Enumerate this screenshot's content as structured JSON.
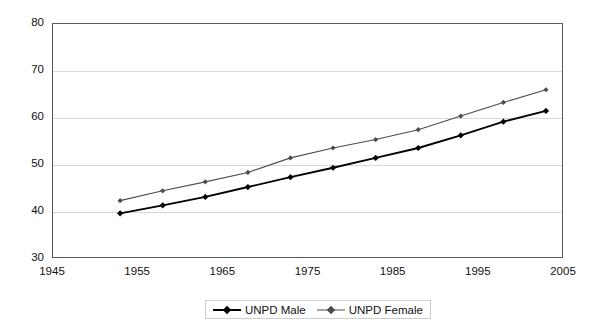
{
  "chart_data": {
    "type": "line",
    "title": "",
    "subtitle": "",
    "xlabel": "",
    "ylabel": "",
    "xlim": [
      1945,
      2005
    ],
    "ylim": [
      30,
      80
    ],
    "xticks": [
      1945,
      1955,
      1965,
      1975,
      1985,
      1995,
      2005
    ],
    "yticks": [
      30,
      40,
      50,
      60,
      70,
      80
    ],
    "grid": "horizontal",
    "legend_position": "bottom-center",
    "x": [
      1953,
      1958,
      1963,
      1968,
      1973,
      1978,
      1983,
      1988,
      1993,
      1998,
      2003
    ],
    "series": [
      {
        "name": "UNPD Male",
        "color": "#000000",
        "marker": "diamond",
        "line_width": 1.9,
        "values": [
          39.5,
          41.2,
          43.0,
          45.1,
          47.2,
          49.2,
          51.3,
          53.4,
          56.1,
          59.0,
          61.3
        ]
      },
      {
        "name": "UNPD Female",
        "color": "#4d4d4d",
        "marker": "diamond",
        "line_width": 1.1,
        "values": [
          42.2,
          44.3,
          46.2,
          48.2,
          51.3,
          53.4,
          55.2,
          57.3,
          60.2,
          63.1,
          65.8
        ]
      }
    ]
  },
  "axes": {
    "y_tick_labels": [
      "80",
      "70",
      "60",
      "50",
      "40",
      "30"
    ],
    "x_tick_labels": [
      "1945",
      "1955",
      "1965",
      "1975",
      "1985",
      "1995",
      "2005"
    ]
  },
  "legend": {
    "items": [
      {
        "label": "UNPD Male",
        "color": "#000000"
      },
      {
        "label": "UNPD Female",
        "color": "#4d4d4d"
      }
    ]
  },
  "colors": {
    "frame": "#555a5e",
    "grid": "#d9d9d9",
    "background": "#ffffff",
    "male": "#000000",
    "female": "#4d4d4d"
  }
}
